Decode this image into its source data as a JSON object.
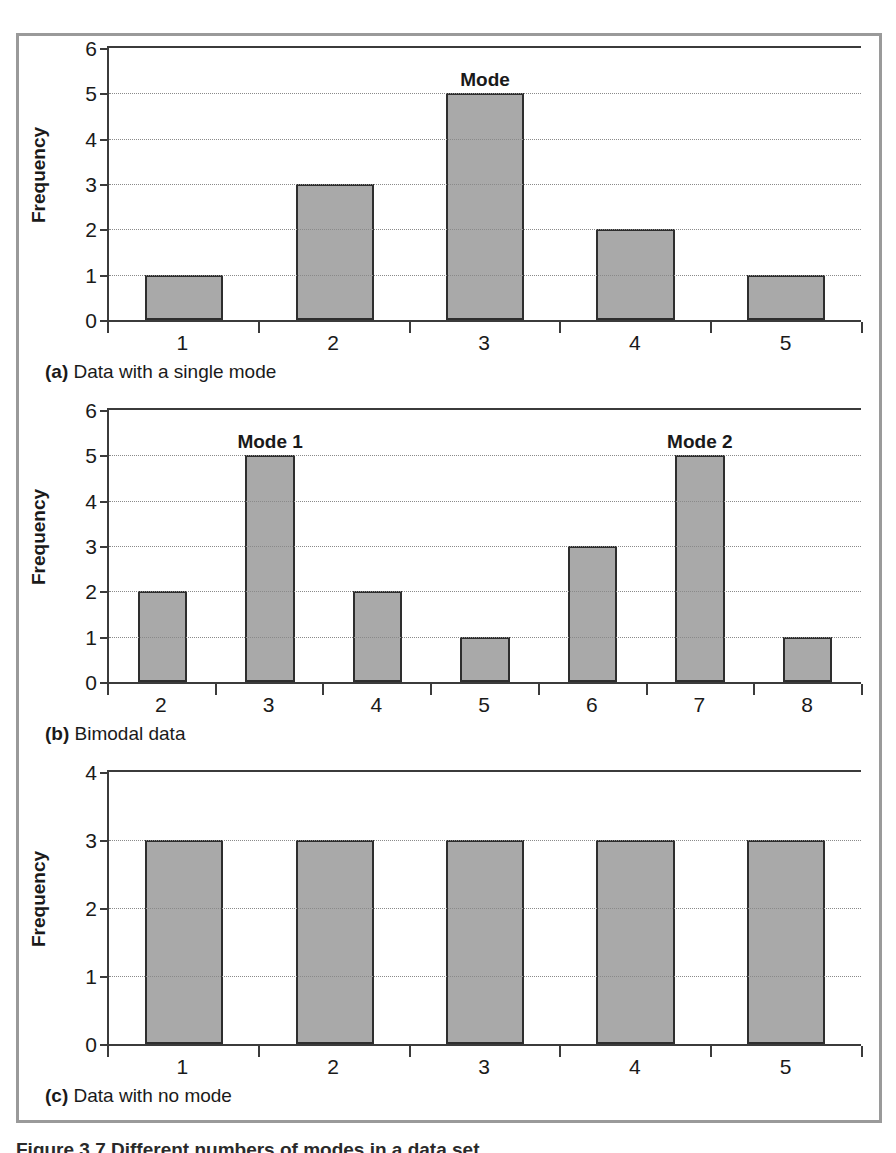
{
  "figure": {
    "caption_partial": "Figure 3.7 Different numbers of modes in a data set",
    "border_color": "#9a9a9a",
    "bar_fill_color": "#a9a9a9",
    "bar_outline_color": "#2e2e2e",
    "axis_color": "#3b3b3b",
    "gridline_color": "#8a8a8a"
  },
  "panels": [
    {
      "id": "a",
      "caption_marker": "(a)",
      "caption_text": "Data with a single mode",
      "ylabel": "Frequency",
      "yticks": [
        "0",
        "1",
        "2",
        "3",
        "4",
        "5",
        "6"
      ],
      "xticks": [
        "1",
        "2",
        "3",
        "4",
        "5"
      ]
    },
    {
      "id": "b",
      "caption_marker": "(b)",
      "caption_text": "Bimodal data",
      "ylabel": "Frequency",
      "yticks": [
        "0",
        "1",
        "2",
        "3",
        "4",
        "5",
        "6"
      ],
      "xticks": [
        "2",
        "3",
        "4",
        "5",
        "6",
        "7",
        "8"
      ]
    },
    {
      "id": "c",
      "caption_marker": "(c)",
      "caption_text": "Data with no mode",
      "ylabel": "Frequency",
      "yticks": [
        "0",
        "1",
        "2",
        "3",
        "4"
      ],
      "xticks": [
        "1",
        "2",
        "3",
        "4",
        "5"
      ]
    }
  ],
  "chart_data": [
    {
      "type": "bar",
      "panel": "a",
      "title": "(a) Data with a single mode",
      "categories": [
        "1",
        "2",
        "3",
        "4",
        "5"
      ],
      "values": [
        1,
        3,
        5,
        2,
        1
      ],
      "xlabel": "",
      "ylabel": "Frequency",
      "ylim": [
        0,
        6
      ],
      "ytick_values": [
        0,
        1,
        2,
        3,
        4,
        5,
        6
      ],
      "grid": "horizontal-dotted",
      "legend": "none",
      "annotations": [
        {
          "text": "Mode",
          "category": "3",
          "value": 5
        }
      ]
    },
    {
      "type": "bar",
      "panel": "b",
      "title": "(b) Bimodal data",
      "categories": [
        "2",
        "3",
        "4",
        "5",
        "6",
        "7",
        "8"
      ],
      "values": [
        2,
        5,
        2,
        1,
        3,
        5,
        1
      ],
      "xlabel": "",
      "ylabel": "Frequency",
      "ylim": [
        0,
        6
      ],
      "ytick_values": [
        0,
        1,
        2,
        3,
        4,
        5,
        6
      ],
      "grid": "horizontal-dotted",
      "legend": "none",
      "annotations": [
        {
          "text": "Mode 1",
          "category": "3",
          "value": 5
        },
        {
          "text": "Mode 2",
          "category": "7",
          "value": 5
        }
      ]
    },
    {
      "type": "bar",
      "panel": "c",
      "title": "(c) Data with no mode",
      "categories": [
        "1",
        "2",
        "3",
        "4",
        "5"
      ],
      "values": [
        3,
        3,
        3,
        3,
        3
      ],
      "xlabel": "",
      "ylabel": "Frequency",
      "ylim": [
        0,
        4
      ],
      "ytick_values": [
        0,
        1,
        2,
        3,
        4
      ],
      "grid": "horizontal-dotted",
      "legend": "none",
      "annotations": []
    }
  ]
}
